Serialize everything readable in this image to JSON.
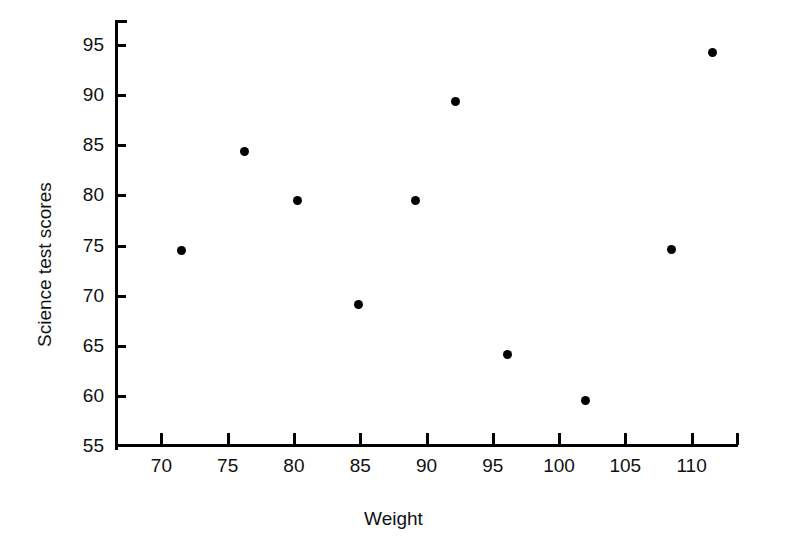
{
  "chart_data": {
    "type": "scatter",
    "title": "",
    "xlabel": "Weight",
    "ylabel": "Science test scores",
    "xlim": [
      66.5,
      113.5
    ],
    "ylim": [
      55,
      97.5
    ],
    "grid": false,
    "legend": null,
    "xticks": [
      70,
      75,
      80,
      85,
      90,
      95,
      100,
      105,
      110
    ],
    "xtick_labels": [
      "70",
      "75",
      "80",
      "85",
      "90",
      "95",
      "100",
      "105",
      "110"
    ],
    "yticks": [
      55,
      60,
      65,
      70,
      75,
      80,
      85,
      90,
      95
    ],
    "ytick_labels": [
      "55",
      "60",
      "65",
      "70",
      "75",
      "80",
      "85",
      "90",
      "95"
    ],
    "marker": "filled-circle",
    "marker_color": "#000000",
    "points": [
      {
        "x": 71.5,
        "y": 74.5
      },
      {
        "x": 76.3,
        "y": 84.4
      },
      {
        "x": 80.3,
        "y": 79.5
      },
      {
        "x": 84.9,
        "y": 69.1
      },
      {
        "x": 89.2,
        "y": 79.5
      },
      {
        "x": 92.2,
        "y": 89.4
      },
      {
        "x": 96.1,
        "y": 64.1
      },
      {
        "x": 102.0,
        "y": 59.5
      },
      {
        "x": 108.5,
        "y": 74.6
      },
      {
        "x": 111.6,
        "y": 94.3
      }
    ]
  }
}
